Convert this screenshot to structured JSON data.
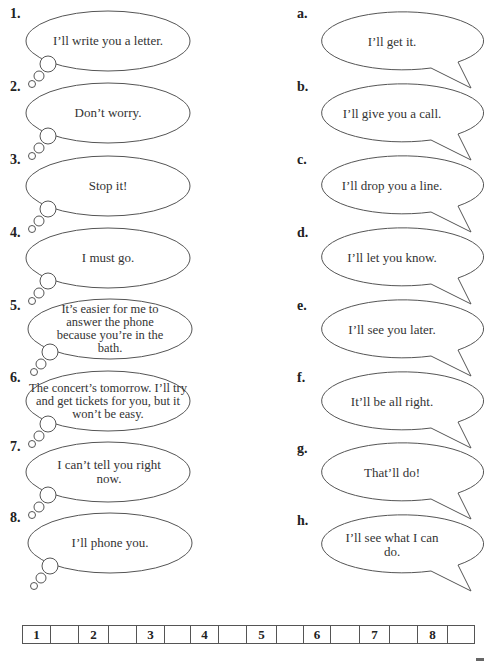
{
  "left_column": {
    "items": [
      {
        "number": "1.",
        "text": "I’ll write you a letter."
      },
      {
        "number": "2.",
        "text": "Don’t worry."
      },
      {
        "number": "3.",
        "text": "Stop it!"
      },
      {
        "number": "4.",
        "text": "I must go."
      },
      {
        "number": "5.",
        "text": "It’s easier for me to answer the phone because you’re in the bath."
      },
      {
        "number": "6.",
        "text": "The concert’s tomorrow. I’ll try and get tickets for you, but it won’t be easy."
      },
      {
        "number": "7.",
        "text": "I can’t tell you right now."
      },
      {
        "number": "8.",
        "text": "I’ll phone you."
      }
    ]
  },
  "right_column": {
    "items": [
      {
        "letter": "a.",
        "text": "I’ll get it."
      },
      {
        "letter": "b.",
        "text": "I’ll give you a call."
      },
      {
        "letter": "c.",
        "text": "I’ll drop you a line."
      },
      {
        "letter": "d.",
        "text": "I’ll let you know."
      },
      {
        "letter": "e.",
        "text": "I’ll see you later."
      },
      {
        "letter": "f.",
        "text": "It’ll be all right."
      },
      {
        "letter": "g.",
        "text": "That’ll do!"
      },
      {
        "letter": "h.",
        "text": "I’ll see what I can do."
      }
    ]
  },
  "answer_grid": {
    "cells": [
      {
        "number": "1",
        "answer": ""
      },
      {
        "number": "2",
        "answer": ""
      },
      {
        "number": "3",
        "answer": ""
      },
      {
        "number": "4",
        "answer": ""
      },
      {
        "number": "5",
        "answer": ""
      },
      {
        "number": "6",
        "answer": ""
      },
      {
        "number": "7",
        "answer": ""
      },
      {
        "number": "8",
        "answer": ""
      }
    ]
  },
  "colors": {
    "outline": "#555555",
    "text": "#333333",
    "background": "#ffffff"
  }
}
